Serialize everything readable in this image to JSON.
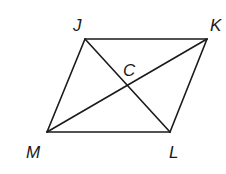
{
  "diagram": {
    "type": "parallelogram-with-diagonals",
    "vertices": {
      "J": {
        "label": "J",
        "x": 85,
        "y": 39,
        "label_x": 73,
        "label_y": 31
      },
      "K": {
        "label": "K",
        "x": 207,
        "y": 39,
        "label_x": 210,
        "label_y": 31
      },
      "L": {
        "label": "L",
        "x": 170,
        "y": 132,
        "label_x": 169,
        "label_y": 158
      },
      "M": {
        "label": "M",
        "x": 47,
        "y": 132,
        "label_x": 26,
        "label_y": 158
      }
    },
    "intersection": {
      "label": "C",
      "x": 127,
      "y": 86,
      "label_x": 123,
      "label_y": 76
    },
    "sides": [
      {
        "from": "J",
        "to": "K"
      },
      {
        "from": "K",
        "to": "L"
      },
      {
        "from": "L",
        "to": "M"
      },
      {
        "from": "M",
        "to": "J"
      }
    ],
    "diagonals": [
      {
        "from": "J",
        "to": "L"
      },
      {
        "from": "M",
        "to": "K"
      }
    ],
    "stroke_color": "#1a1a1a",
    "background": "#ffffff"
  }
}
